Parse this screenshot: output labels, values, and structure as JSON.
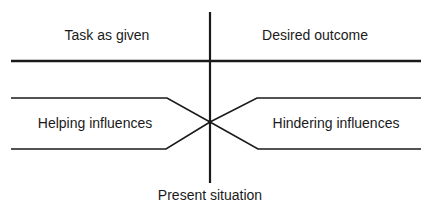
{
  "diagram": {
    "type": "force-field-analysis",
    "labels": {
      "task_as_given": "Task as given",
      "desired_outcome": "Desired outcome",
      "helping_influences": "Helping influences",
      "hindering_influences": "Hindering influences",
      "present_situation": "Present situation"
    },
    "colors": {
      "line": "#1a1a1a",
      "text": "#1a1a1a",
      "background": "#ffffff"
    }
  }
}
